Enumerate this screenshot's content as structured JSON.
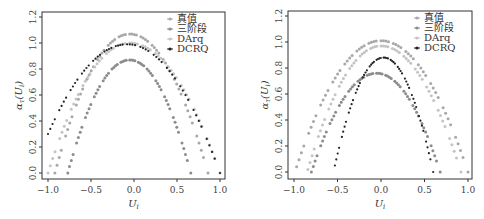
{
  "chart_data": [
    {
      "type": "scatter",
      "title": "",
      "xlabel": "U_i",
      "ylabel": "α_τ(U_i)",
      "xlim": [
        -1.05,
        1.05
      ],
      "ylim": [
        -0.02,
        1.24
      ],
      "xticks": [
        "-1.0",
        "-0.5",
        "0.0",
        "0.5",
        "1.0"
      ],
      "yticks": [
        "0.0",
        "0.2",
        "0.4",
        "0.6",
        "0.8",
        "1.0",
        "1.2"
      ],
      "legend_position": "upper right",
      "grid": false,
      "series": [
        {
          "name": "真值",
          "color": "#a8a8a8",
          "shape": "parabola",
          "peak_x": -0.05,
          "peak_y": 1.07,
          "x_start": -0.92,
          "y_start": 0.0,
          "x_end": 0.86,
          "y_end": 0.0
        },
        {
          "name": "三阶段",
          "color": "#8c8c8c",
          "shape": "parabola",
          "peak_x": -0.05,
          "peak_y": 0.87,
          "x_start": -0.77,
          "y_start": 0.0,
          "x_end": 0.66,
          "y_end": 0.0
        },
        {
          "name": "DArq",
          "color": "#c4c4c4",
          "shape": "parabola",
          "peak_x": -0.05,
          "peak_y": 1.0,
          "x_start": -1.0,
          "y_start": 0.0,
          "x_end": 1.0,
          "y_end": 0.0
        },
        {
          "name": "DCRQ",
          "color": "#222222",
          "shape": "parabola",
          "peak_x": -0.08,
          "peak_y": 0.99,
          "x_start": -1.0,
          "y_start": 0.3,
          "x_end": 1.0,
          "y_end": 0.0
        }
      ]
    },
    {
      "type": "scatter",
      "title": "",
      "xlabel": "U_i",
      "ylabel": "α_τ(U_i)",
      "xlim": [
        -1.05,
        1.05
      ],
      "ylim": [
        -0.02,
        1.24
      ],
      "xticks": [
        "-1.0",
        "-0.5",
        "0.0",
        "0.5",
        "1.0"
      ],
      "yticks": [
        "0.0",
        "0.2",
        "0.4",
        "0.6",
        "0.8",
        "1.0",
        "1.2"
      ],
      "legend_position": "upper right",
      "grid": false,
      "series": [
        {
          "name": "真值",
          "color": "#a8a8a8",
          "shape": "parabola",
          "peak_x": 0.0,
          "peak_y": 1.01,
          "x_start": -0.97,
          "y_start": 0.04,
          "x_end": 1.0,
          "y_end": 0.0
        },
        {
          "name": "三阶段",
          "color": "#8c8c8c",
          "shape": "parabola",
          "peak_x": -0.05,
          "peak_y": 0.76,
          "x_start": -0.8,
          "y_start": 0.0,
          "x_end": 0.68,
          "y_end": 0.0
        },
        {
          "name": "DArq",
          "color": "#c4c4c4",
          "shape": "parabola",
          "peak_x": 0.0,
          "peak_y": 0.97,
          "x_start": -0.84,
          "y_start": 0.02,
          "x_end": 0.92,
          "y_end": 0.0
        },
        {
          "name": "DCRQ",
          "color": "#222222",
          "shape": "parabola",
          "peak_x": 0.03,
          "peak_y": 0.88,
          "x_start": -0.53,
          "y_start": 0.05,
          "x_end": 0.6,
          "y_end": 0.0
        }
      ]
    }
  ],
  "panels": [
    {
      "x_min_px": 48,
      "x_max_px": 220,
      "y0_px": 173,
      "px_per_unit_y": 130,
      "frame": {
        "x": 42,
        "y": 12,
        "w": 183,
        "h": 167
      }
    },
    {
      "x_min_px": 294,
      "x_max_px": 468,
      "y0_px": 172,
      "px_per_unit_y": 130,
      "frame": {
        "x": 288,
        "y": 11,
        "w": 184,
        "h": 168
      }
    }
  ]
}
